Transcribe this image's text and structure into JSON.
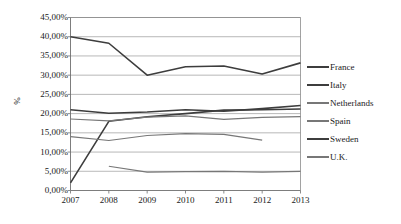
{
  "chart_data": {
    "type": "line",
    "title": "",
    "xlabel": "",
    "ylabel": "%",
    "x": [
      "2007",
      "2008",
      "2009",
      "2010",
      "2011",
      "2012",
      "2013"
    ],
    "categories": [
      "2007",
      "2008",
      "2009",
      "2010",
      "2011",
      "2012",
      "2013"
    ],
    "ylim": [
      0,
      45
    ],
    "ytick_labels": [
      "45,00%",
      "40,00%",
      "35,00%",
      "30,00%",
      "25,00%",
      "20,00%",
      "15,00%",
      "10,00%",
      "5,00%",
      "0,00%"
    ],
    "ytick_values": [
      45,
      40,
      35,
      30,
      25,
      20,
      15,
      10,
      5,
      0
    ],
    "grid": true,
    "legend_position": "right",
    "series": [
      {
        "name": "France",
        "color": "#3d3d3d",
        "width": 1.6,
        "values": [
          21.0,
          20.1,
          20.4,
          21.0,
          20.6,
          21.3,
          22.1
        ]
      },
      {
        "name": "Italy",
        "color": "#3d3d3d",
        "width": 1.6,
        "values": [
          2.0,
          18.0,
          19.2,
          20.0,
          20.9,
          21.0,
          21.2
        ]
      },
      {
        "name": "Netherlands",
        "color": "#777777",
        "width": 1.2,
        "values": [
          18.6,
          18.1,
          19.1,
          19.4,
          18.5,
          19.0,
          19.2
        ]
      },
      {
        "name": "Spain",
        "color": "#777777",
        "width": 1.2,
        "values": [
          14.0,
          13.0,
          14.3,
          14.8,
          14.6,
          13.1,
          null
        ]
      },
      {
        "name": "Sweden",
        "color": "#3d3d3d",
        "width": 1.6,
        "values": [
          40.0,
          38.3,
          30.0,
          32.2,
          32.4,
          30.3,
          33.2
        ]
      },
      {
        "name": "U.K.",
        "color": "#777777",
        "width": 1.2,
        "values": [
          null,
          6.3,
          4.8,
          4.9,
          5.0,
          4.8,
          5.0
        ]
      }
    ]
  },
  "legend": {
    "items": [
      {
        "label": "France"
      },
      {
        "label": "Italy"
      },
      {
        "label": "Netherlands"
      },
      {
        "label": "Spain"
      },
      {
        "label": "Sweden"
      },
      {
        "label": "U.K."
      }
    ]
  }
}
